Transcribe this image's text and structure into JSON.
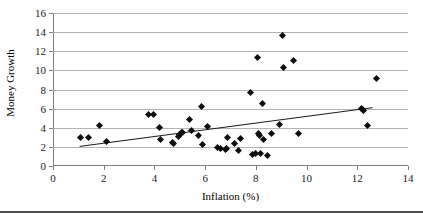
{
  "chart_data": {
    "type": "scatter",
    "title": "",
    "xlabel": "Inflation (%)",
    "ylabel": "Money Growth",
    "xlim": [
      0,
      14
    ],
    "ylim": [
      0,
      16
    ],
    "xticks": [
      0,
      2,
      4,
      6,
      8,
      10,
      12,
      14
    ],
    "yticks": [
      0,
      2,
      4,
      6,
      8,
      10,
      12,
      14,
      16
    ],
    "grid": "horizontal",
    "legend": "none",
    "marker": "filled-diamond",
    "marker_color": "#0d0d0d",
    "points": [
      {
        "x": 1.1,
        "y": 3.0
      },
      {
        "x": 1.4,
        "y": 2.95
      },
      {
        "x": 1.85,
        "y": 4.2
      },
      {
        "x": 2.1,
        "y": 2.6
      },
      {
        "x": 3.75,
        "y": 5.4
      },
      {
        "x": 3.95,
        "y": 5.4
      },
      {
        "x": 4.2,
        "y": 4.0
      },
      {
        "x": 4.25,
        "y": 2.75
      },
      {
        "x": 4.7,
        "y": 2.45
      },
      {
        "x": 4.75,
        "y": 2.35
      },
      {
        "x": 4.95,
        "y": 3.05
      },
      {
        "x": 5.0,
        "y": 3.3
      },
      {
        "x": 5.05,
        "y": 3.5
      },
      {
        "x": 5.1,
        "y": 3.55
      },
      {
        "x": 5.4,
        "y": 4.85
      },
      {
        "x": 5.45,
        "y": 3.75
      },
      {
        "x": 5.75,
        "y": 3.2
      },
      {
        "x": 5.85,
        "y": 6.2
      },
      {
        "x": 5.9,
        "y": 2.2
      },
      {
        "x": 6.1,
        "y": 4.15
      },
      {
        "x": 6.5,
        "y": 1.9
      },
      {
        "x": 6.6,
        "y": 1.85
      },
      {
        "x": 6.8,
        "y": 1.75
      },
      {
        "x": 6.85,
        "y": 1.8
      },
      {
        "x": 6.9,
        "y": 2.95
      },
      {
        "x": 7.15,
        "y": 2.35
      },
      {
        "x": 7.3,
        "y": 1.6
      },
      {
        "x": 7.4,
        "y": 2.85
      },
      {
        "x": 7.8,
        "y": 7.65
      },
      {
        "x": 7.85,
        "y": 1.2
      },
      {
        "x": 8.0,
        "y": 1.3
      },
      {
        "x": 8.05,
        "y": 11.3
      },
      {
        "x": 8.1,
        "y": 3.4
      },
      {
        "x": 8.15,
        "y": 3.2
      },
      {
        "x": 8.2,
        "y": 1.3
      },
      {
        "x": 8.25,
        "y": 6.5
      },
      {
        "x": 8.3,
        "y": 2.8
      },
      {
        "x": 8.45,
        "y": 1.15
      },
      {
        "x": 8.6,
        "y": 3.4
      },
      {
        "x": 8.95,
        "y": 4.3
      },
      {
        "x": 9.05,
        "y": 13.6
      },
      {
        "x": 9.1,
        "y": 10.35
      },
      {
        "x": 9.5,
        "y": 11.05
      },
      {
        "x": 9.7,
        "y": 3.35
      },
      {
        "x": 12.15,
        "y": 6.0
      },
      {
        "x": 12.2,
        "y": 5.95
      },
      {
        "x": 12.25,
        "y": 5.85
      },
      {
        "x": 12.4,
        "y": 4.25
      },
      {
        "x": 12.75,
        "y": 9.2
      }
    ],
    "trendline": {
      "type": "linear",
      "x_start": 1.05,
      "y_start": 2.05,
      "x_end": 12.6,
      "y_end": 6.1,
      "color": "#1a1a1a"
    }
  }
}
